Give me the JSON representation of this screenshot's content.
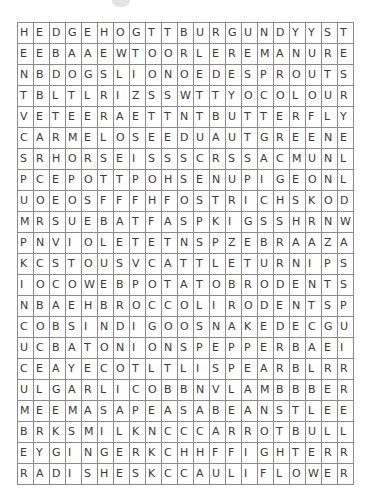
{
  "puzzle": {
    "rows": [
      "HEDGEHOGTTBURGUNDYYST",
      "EEBAAEWTOORLEREMANURE",
      "NBDOGSLIONOEDESPROUTS",
      "TBLTLRIZSSWTTYOCOLOUR",
      "VETEERAETTNTBUTTERFLY",
      "CARMELOSEEDUAUTGREENE",
      "SRHORSEISSSCRSSACMUNL",
      "PCEPOTTPOHSENUPIGEONL",
      "UOEOSFFFHFOSTRICHSKOD",
      "MRSUEBATFASPKIGSSHRNW",
      "PNVIOLETETNSPZEBRAAZA",
      "KCSTOUSVCATTLETURNIPS",
      "IOCOWEBPOTATOBRODENTS",
      "NBAEHBROCCOLIRODENTSP",
      "COBSINDIGOOSNAKEDECGU",
      "UCBATONIONSPEPPERBAEI",
      "CEAYECOTLTLISPEARBLRR",
      "ULGARLICOBBNVLAMBBBER",
      "MEEMASAPEASABEANSTLEE",
      "BRKSMILKNCCCARROTBULL",
      "EYGINGERKCHHFFIGHTERR",
      "RADISHESKCCAULIFLOWER"
    ]
  }
}
